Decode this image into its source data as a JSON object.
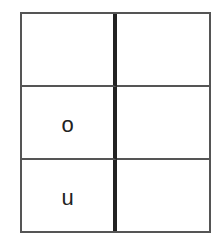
{
  "table": {
    "rows": [
      {
        "left": "",
        "right": ""
      },
      {
        "left": "o",
        "right": ""
      },
      {
        "left": "u",
        "right": ""
      }
    ]
  },
  "colors": {
    "outer_border": "#555555",
    "center_divider": "#222222",
    "text": "#222222",
    "background": "#ffffff"
  }
}
